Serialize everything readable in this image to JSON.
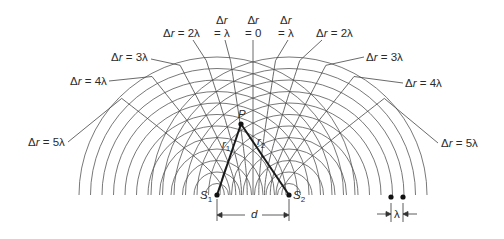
{
  "figure": {
    "geometry": {
      "S1": [
        217,
        195
      ],
      "S2": [
        289,
        195
      ],
      "P": [
        241,
        124
      ],
      "wavelength_px": 11.5,
      "arc_count": 12
    },
    "colors": {
      "line": "#555555",
      "bold": "#1a1a1a",
      "text": "#2a2a2a"
    },
    "points": {
      "S1": {
        "letter": "S",
        "sub": "1"
      },
      "S2": {
        "letter": "S",
        "sub": "2"
      },
      "P": {
        "letter": "P"
      }
    },
    "distances": {
      "r1": {
        "letter": "r",
        "sub": "1"
      },
      "r2": {
        "letter": "r",
        "sub": "2"
      },
      "d": "d",
      "lambda": "λ"
    },
    "path_difference_labels": [
      {
        "id": "left-5",
        "n": -5,
        "text": "Δr = 5λ",
        "x": 28,
        "y": 136,
        "anchor": [
          68,
          142
        ]
      },
      {
        "id": "left-4",
        "n": -4,
        "text": "Δr = 4λ",
        "x": 70,
        "y": 75,
        "anchor": [
          109,
          81
        ]
      },
      {
        "id": "left-3",
        "n": -3,
        "text": "Δr = 3λ",
        "x": 111,
        "y": 51,
        "anchor": [
          151,
          59
        ]
      },
      {
        "id": "left-2",
        "n": -2,
        "text": "Δr = 2λ",
        "x": 163,
        "y": 27,
        "anchor": [
          193,
          40
        ]
      },
      {
        "id": "left-1",
        "n": -1,
        "top": "Δr",
        "bottom": "= λ",
        "x": 214,
        "y": 14,
        "anchor": [
          225,
          40
        ]
      },
      {
        "id": "zero",
        "n": 0,
        "top": "Δr",
        "bottom": "= 0",
        "x": 245,
        "y": 14,
        "anchor": [
          253,
          40
        ]
      },
      {
        "id": "right-1",
        "n": 1,
        "top": "Δr",
        "bottom": "= λ",
        "x": 278,
        "y": 14,
        "anchor": [
          288,
          40
        ]
      },
      {
        "id": "right-2",
        "n": 2,
        "text": "Δr = 2λ",
        "x": 316,
        "y": 27,
        "anchor": [
          322,
          40
        ]
      },
      {
        "id": "right-3",
        "n": 3,
        "text": "Δr = 3λ",
        "x": 366,
        "y": 51,
        "anchor": [
          364,
          57
        ]
      },
      {
        "id": "right-4",
        "n": 4,
        "text": "Δr = 4λ",
        "x": 405,
        "y": 77,
        "anchor": [
          403,
          83
        ]
      },
      {
        "id": "right-5",
        "n": 5,
        "text": "Δr = 5λ",
        "x": 441,
        "y": 137,
        "anchor": [
          438,
          143
        ]
      }
    ],
    "wavelength_marker": {
      "dot1": [
        391,
        197
      ],
      "dot2": [
        403,
        197
      ],
      "label": "λ"
    }
  }
}
